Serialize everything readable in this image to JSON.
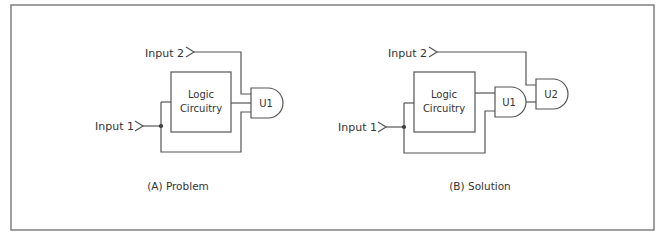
{
  "figure": {
    "panels": [
      {
        "id": "A",
        "caption": "(A) Problem",
        "input_2": "Input 2",
        "input_1": "Input 1",
        "logic_line1": "Logic",
        "logic_line2": "Circuitry",
        "gates": [
          {
            "label": "U1"
          }
        ]
      },
      {
        "id": "B",
        "caption": "(B) Solution",
        "input_2": "Input 2",
        "input_1": "Input 1",
        "logic_line1": "Logic",
        "logic_line2": "Circuitry",
        "gates": [
          {
            "label": "U1"
          },
          {
            "label": "U2"
          }
        ]
      }
    ]
  }
}
